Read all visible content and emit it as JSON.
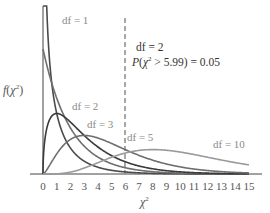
{
  "chart_data": {
    "type": "line",
    "title": "",
    "xlabel": "χ²",
    "ylabel": "f(χ²)",
    "xlim": [
      0,
      15
    ],
    "x_ticks": [
      "0",
      "1",
      "2",
      "3",
      "4",
      "5",
      "6",
      "7",
      "8",
      "9",
      "10",
      "11",
      "12",
      "13",
      "14",
      "15"
    ],
    "grid": false,
    "legend_position": "inline labels",
    "series": [
      {
        "name": "df = 1",
        "df": 1,
        "color": "#4a4a4a",
        "label_pos": [
          1.4,
          "top"
        ]
      },
      {
        "name": "df = 2",
        "df": 2,
        "color": "#6e6e6e",
        "label_pos": [
          2.5,
          0.33
        ]
      },
      {
        "name": "df = 3",
        "df": 3,
        "color": "#3a3a3a",
        "label_pos": [
          3.6,
          0.22
        ]
      },
      {
        "name": "df = 5",
        "df": 5,
        "color": "#6e6e6e",
        "label_pos": [
          6.0,
          0.12
        ]
      },
      {
        "name": "df = 10",
        "df": 10,
        "color": "#9a9a9a",
        "label_pos": [
          12.3,
          0.11
        ]
      }
    ],
    "annotations": [
      {
        "type": "vline",
        "x": 5.99,
        "style": "dashed",
        "color": "#8a8a8a"
      },
      {
        "type": "text",
        "text": "df = 2",
        "x": 6.3,
        "y": 0.52
      },
      {
        "type": "text",
        "text": "P(χ² > 5.99) = 0.05",
        "x": 6.3,
        "y": 0.45
      }
    ]
  },
  "labels": {
    "df1": "df = 1",
    "df2": "df = 2",
    "df3": "df = 3",
    "df5": "df = 5",
    "df10": "df = 10",
    "annot_df": "df = 2",
    "annot_prob": "P(χ² > 5.99) = 0.05",
    "ylabel_f": "f",
    "ylabel_chi": "(χ",
    "ylabel_sup": "2",
    "ylabel_close": ")",
    "xlabel_chi": "χ",
    "xlabel_sup": "2"
  }
}
